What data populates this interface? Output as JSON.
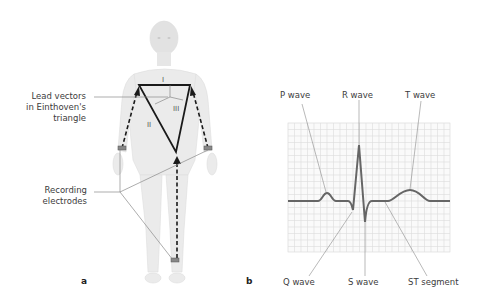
{
  "figure": {
    "panel_a": {
      "label": "a",
      "callouts": {
        "lead_vectors": [
          "Lead vectors",
          "in Einthoven's",
          "triangle"
        ],
        "recording_electrodes": [
          "Recording",
          "electrodes"
        ]
      },
      "leads": [
        "I",
        "II",
        "III"
      ]
    },
    "panel_b": {
      "label": "b",
      "top_labels": [
        "P wave",
        "R wave",
        "T wave"
      ],
      "bottom_labels": [
        "Q wave",
        "S wave",
        "ST segment"
      ]
    },
    "colors": {
      "background": "#ffffff",
      "body": "#e6e6e6",
      "trace": "#666666",
      "grid": "#d9d9d9",
      "leader_line": "#8a8a8a",
      "triangle": "#1a1a1a"
    }
  }
}
